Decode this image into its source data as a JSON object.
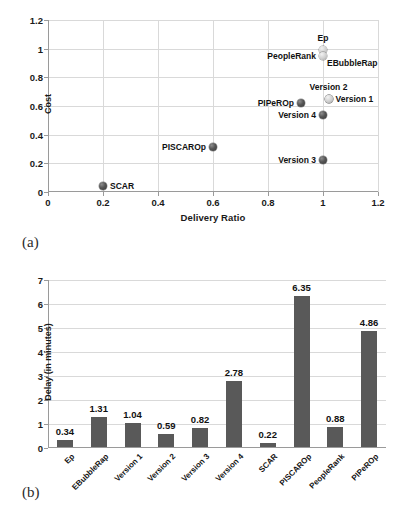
{
  "chart_data": [
    {
      "type": "scatter",
      "panel": "(a)",
      "title": "",
      "xlabel": "Delivery Ratio",
      "ylabel": "Cost",
      "xlim": [
        0,
        1.2
      ],
      "ylim": [
        0,
        1.2
      ],
      "xticks": [
        "0",
        "0.2",
        "0.4",
        "0.6",
        "0.8",
        "1",
        "1.2"
      ],
      "xtick_values": [
        0,
        0.2,
        0.4,
        0.6,
        0.8,
        1,
        1.2
      ],
      "yticks": [
        "0",
        "0.2",
        "0.4",
        "0.6",
        "0.8",
        "1",
        "1.2"
      ],
      "ytick_values": [
        0,
        0.2,
        0.4,
        0.6,
        0.8,
        1,
        1.2
      ],
      "grid": true,
      "legend": "none",
      "points": [
        {
          "label": "Ep",
          "x": 1.0,
          "y": 0.99,
          "label_pos": "top",
          "marker": "light"
        },
        {
          "label": "PeopleRank",
          "x": 1.0,
          "y": 0.95,
          "label_pos": "left",
          "marker": "light"
        },
        {
          "label": "EBubbleRap",
          "x": 1.0,
          "y": 0.95,
          "label_pos": "right-below",
          "marker": "light"
        },
        {
          "label": "Version 2",
          "x": 1.02,
          "y": 0.65,
          "label_pos": "top",
          "marker": "light"
        },
        {
          "label": "Version 1",
          "x": 1.02,
          "y": 0.65,
          "label_pos": "right",
          "marker": "light"
        },
        {
          "label": "PIPeROp",
          "x": 0.92,
          "y": 0.62,
          "label_pos": "left",
          "marker": "dark"
        },
        {
          "label": "Version 4",
          "x": 1.0,
          "y": 0.54,
          "label_pos": "left",
          "marker": "dark"
        },
        {
          "label": "PISCAROp",
          "x": 0.6,
          "y": 0.315,
          "label_pos": "left",
          "marker": "dark"
        },
        {
          "label": "Version 3",
          "x": 1.0,
          "y": 0.225,
          "label_pos": "left",
          "marker": "dark"
        },
        {
          "label": "SCAR",
          "x": 0.2,
          "y": 0.04,
          "label_pos": "right",
          "marker": "dark"
        }
      ]
    },
    {
      "type": "bar",
      "panel": "(b)",
      "title": "",
      "xlabel": "",
      "ylabel": "Delay (in minutes)",
      "ylim": [
        0,
        7
      ],
      "yticks": [
        "0",
        "1",
        "2",
        "3",
        "4",
        "5",
        "6",
        "7"
      ],
      "ytick_values": [
        0,
        1,
        2,
        3,
        4,
        5,
        6,
        7
      ],
      "grid": true,
      "legend": "none",
      "bar_color": "#595959",
      "categories": [
        "Ep",
        "EBubbleRap",
        "Version 1",
        "Version 2",
        "Version 3",
        "Version 4",
        "SCAR",
        "PISCAROp",
        "PeopleRank",
        "PIPeROp"
      ],
      "values": [
        0.34,
        1.31,
        1.04,
        0.59,
        0.82,
        2.78,
        0.22,
        6.35,
        0.88,
        4.86
      ],
      "value_labels": [
        "0.34",
        "1.31",
        "1.04",
        "0.59",
        "0.82",
        "2.78",
        "0.22",
        "6.35",
        "0.88",
        "4.86"
      ]
    }
  ]
}
